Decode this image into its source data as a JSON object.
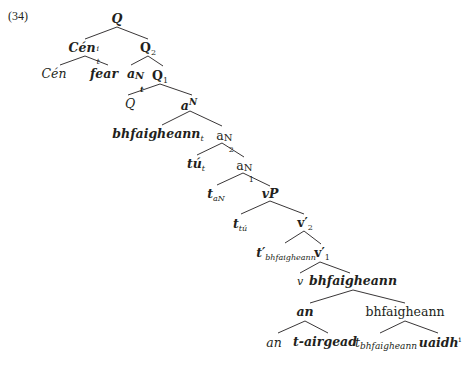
{
  "example_number": "(34)",
  "tree": {
    "root": "Q",
    "n_cen": {
      "base": "Cén",
      "sup": "i",
      "sub": "t"
    },
    "n_q2": {
      "base": "Q",
      "sub": "2"
    },
    "n_cen_leaf": "Cén",
    "n_fear": "fear",
    "n_aNt": {
      "base": "a",
      "sup": "N",
      "sub": "t"
    },
    "n_q1": {
      "base": "Q",
      "sub": "1"
    },
    "n_q_leaf": "Q",
    "n_aN": {
      "base": "a",
      "sup": "N"
    },
    "n_bhf_t": {
      "base": "bhfaigheann",
      "sub": "t"
    },
    "n_aN2": {
      "base": "a",
      "sup": "N",
      "sub": "2"
    },
    "n_tu_t": {
      "base": "tú",
      "sub": "t"
    },
    "n_aN1": {
      "base": "a",
      "sup": "N",
      "sub": "1"
    },
    "n_t_aN": {
      "base": "t",
      "sub": "aN"
    },
    "n_vP": "vP",
    "n_t_tu": {
      "base": "t",
      "sub": "tú"
    },
    "n_v2": {
      "base": "v′",
      "sub": "2"
    },
    "n_tprime_bhf": {
      "base": "t′",
      "sub": "bhfaigheann"
    },
    "n_v1": {
      "base": "v′",
      "sub": "1"
    },
    "n_v_leaf": "v",
    "n_bhf_mid": "bhfaigheann",
    "n_an": "an",
    "n_bhf_plain": "bhfaigheann",
    "n_an_leaf": "an",
    "n_tairgead": "t-airgead",
    "n_t_bhf": {
      "base": "t",
      "sub": "bhfaigheann"
    },
    "n_uaidh": {
      "base": "uaidh",
      "sup": "i"
    }
  },
  "edges": [
    [
      117,
      27,
      85,
      39
    ],
    [
      117,
      27,
      148,
      39
    ],
    [
      85,
      56,
      60,
      65
    ],
    [
      85,
      56,
      108,
      65
    ],
    [
      148,
      56,
      131,
      65
    ],
    [
      148,
      56,
      163,
      66
    ],
    [
      160,
      84,
      128,
      95
    ],
    [
      160,
      84,
      192,
      95
    ],
    [
      190,
      111,
      162,
      125
    ],
    [
      190,
      111,
      222,
      126
    ],
    [
      222,
      143,
      197,
      155
    ],
    [
      222,
      143,
      244,
      157
    ],
    [
      243,
      173,
      217,
      185
    ],
    [
      243,
      173,
      270,
      186
    ],
    [
      270,
      201,
      241,
      214
    ],
    [
      270,
      201,
      304,
      214
    ],
    [
      304,
      231,
      285,
      243
    ],
    [
      304,
      231,
      321,
      244
    ],
    [
      320,
      262,
      300,
      273
    ],
    [
      320,
      262,
      350,
      273
    ],
    [
      353,
      290,
      310,
      303
    ],
    [
      353,
      290,
      405,
      303
    ],
    [
      305,
      321,
      278,
      333
    ],
    [
      305,
      321,
      328,
      333
    ],
    [
      405,
      321,
      380,
      333
    ],
    [
      405,
      321,
      438,
      333
    ]
  ]
}
